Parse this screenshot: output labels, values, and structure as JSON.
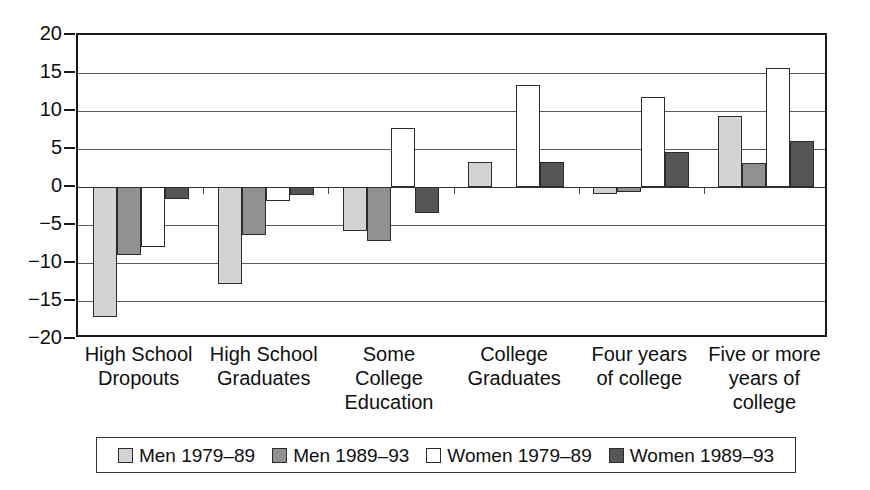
{
  "chart_data": {
    "type": "bar",
    "title": "",
    "subtitle": "",
    "xlabel": "",
    "ylabel": "",
    "ylim": [
      -20,
      20
    ],
    "yticks": [
      20,
      15,
      10,
      5,
      0,
      -5,
      -10,
      -15,
      -20
    ],
    "ytick_labels": [
      "20",
      "15",
      "10",
      "5",
      "0",
      "−5",
      "−10",
      "−15",
      "−20"
    ],
    "grid": true,
    "legend_position": "bottom",
    "categories": [
      "High School Dropouts",
      "High School Graduates",
      "Some College Education",
      "College Graduates",
      "Four years of college",
      "Five or more years of college"
    ],
    "category_lines": [
      [
        "High School",
        "Dropouts"
      ],
      [
        "High School",
        "Graduates"
      ],
      [
        "Some College",
        "Education"
      ],
      [
        "College",
        "Graduates"
      ],
      [
        "Four years",
        "of college"
      ],
      [
        "Five or more",
        "years of",
        "college"
      ]
    ],
    "series": [
      {
        "name": "Men 1979–89",
        "color": "#d3d3d3",
        "values": [
          -17.1,
          -12.7,
          -5.8,
          3.3,
          -0.9,
          9.3
        ]
      },
      {
        "name": "Men 1989–93",
        "color": "#919191",
        "values": [
          -8.9,
          -6.3,
          -7.1,
          0.0,
          -0.7,
          3.2
        ]
      },
      {
        "name": "Women 1979–89",
        "color": "#ffffff",
        "values": [
          -7.9,
          -1.8,
          7.8,
          13.4,
          11.8,
          15.7
        ]
      },
      {
        "name": "Women 1989–93",
        "color": "#565656",
        "values": [
          -1.6,
          -1.0,
          -3.4,
          3.3,
          4.6,
          6.0
        ]
      }
    ]
  },
  "legend": {
    "items": [
      {
        "label": "Men 1979–89",
        "swatch": "#d3d3d3"
      },
      {
        "label": "Men 1989–93",
        "swatch": "#919191"
      },
      {
        "label": "Women 1979–89",
        "swatch": "#ffffff"
      },
      {
        "label": "Women 1989–93",
        "swatch": "#565656"
      }
    ]
  }
}
